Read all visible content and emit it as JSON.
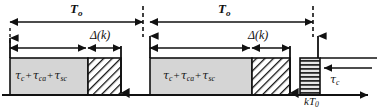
{
  "figure": {
    "kind": "timing-diagram",
    "width": 377,
    "height": 112,
    "background": "#ffffff",
    "ink": "#111111"
  },
  "colors": {
    "line": "#111111",
    "block_fill": "#d5d5d5",
    "block_stroke": "#111111",
    "hatch_fill": "#ffffff",
    "hatch_stroke": "#111111",
    "stripe_fill": "#e2e2e2",
    "dash": "#111111"
  },
  "axis": {
    "name": "time-axis",
    "y": 95,
    "x_start": 2,
    "x_end": 372,
    "arrowhead": "right",
    "tick_label": "kT",
    "tick_label_sub": "0",
    "tick_x": 318
  },
  "periods": [
    {
      "index": 1,
      "period_label": "T",
      "period_label_sub": "o",
      "period_arrow": {
        "x1": 10,
        "x2": 143,
        "y": 22
      },
      "span_arrow": {
        "x1": 10,
        "x2": 121,
        "y": 48
      },
      "delta_label": "Δ(k)",
      "delta_arrow": {
        "x1": 88,
        "x2": 121,
        "y": 48
      },
      "gray_block": {
        "x": 10,
        "y": 58,
        "w": 78,
        "h": 37
      },
      "gray_block_text": "τc + τca + τsc",
      "hatched_block": {
        "x": 88,
        "y": 58,
        "w": 33,
        "h": 37
      },
      "start_marker_x": 10,
      "end_marker_x": 121,
      "boundary_dash_x": 143
    },
    {
      "index": 2,
      "period_label": "T",
      "period_label_sub": "o",
      "period_arrow": {
        "x1": 150,
        "x2": 313,
        "y": 22
      },
      "span_arrow": {
        "x1": 150,
        "x2": 290,
        "y": 48
      },
      "delta_label": "Δ(k)",
      "delta_arrow": {
        "x1": 252,
        "x2": 290,
        "y": 48
      },
      "gray_block": {
        "x": 150,
        "y": 58,
        "w": 102,
        "h": 37
      },
      "gray_block_text": "τc + τca + τsc",
      "hatched_block": {
        "x": 252,
        "y": 58,
        "w": 38,
        "h": 37
      },
      "start_marker_x": 150,
      "end_marker_x": 290,
      "boundary_dash_x": 313
    }
  ],
  "terminal": {
    "name": "controller-computation-block",
    "striped_block": {
      "x": 300,
      "y": 58,
      "w": 20,
      "h": 37
    },
    "label": "τc",
    "label_x": 330,
    "label_y": 74,
    "inbound_arrow": {
      "x1": 372,
      "x2": 322,
      "y": 68
    }
  },
  "symbols": {
    "tau": "τ",
    "delta": "Δ",
    "plus": "+",
    "k": "k",
    "sub_c": "c",
    "sub_ca": "ca",
    "sub_sc": "sc",
    "sub_o": "o",
    "sub_zero": "0"
  },
  "labels": {
    "period_1": "T",
    "period_1_sub": "o",
    "period_2": "T",
    "period_2_sub": "o",
    "delta_1": "Δ(k)",
    "delta_2": "Δ(k)",
    "axis_tick": "kT",
    "axis_tick_sub": "0",
    "tau_c": "τ",
    "tau_c_sub": "c"
  }
}
